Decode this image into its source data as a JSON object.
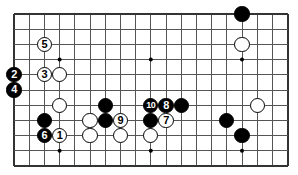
{
  "figure": {
    "name": "go-board-diagram",
    "width": 298,
    "height": 175,
    "background_color": "#ffffff",
    "line_color": "#555555",
    "border_color": "#333333",
    "black_color": "#000000",
    "white_color": "#ffffff"
  },
  "board": {
    "origin_x": 14,
    "origin_y": 14,
    "spacing": 15.2,
    "cols": 19,
    "rows": 11,
    "left_edge": true,
    "top_edge": true,
    "right_edge": true,
    "bottom_edge": true,
    "stone_radius": 7.6,
    "star_points": [
      {
        "col": 3,
        "row": 3
      },
      {
        "col": 9,
        "row": 3
      },
      {
        "col": 15,
        "row": 3
      },
      {
        "col": 3,
        "row": 9
      },
      {
        "col": 9,
        "row": 9
      },
      {
        "col": 15,
        "row": 9
      }
    ]
  },
  "stones": [
    {
      "col": 15,
      "row": 0,
      "color": "black",
      "label": ""
    },
    {
      "col": 2,
      "row": 2,
      "color": "white",
      "label": "5"
    },
    {
      "col": 15,
      "row": 2,
      "color": "white",
      "label": ""
    },
    {
      "col": 0,
      "row": 4,
      "color": "black",
      "label": "2"
    },
    {
      "col": 2,
      "row": 4,
      "color": "white",
      "label": "3"
    },
    {
      "col": 3,
      "row": 4,
      "color": "white",
      "label": ""
    },
    {
      "col": 0,
      "row": 5,
      "color": "black",
      "label": "4"
    },
    {
      "col": 3,
      "row": 6,
      "color": "white",
      "label": ""
    },
    {
      "col": 6,
      "row": 6,
      "color": "black",
      "label": ""
    },
    {
      "col": 9,
      "row": 6,
      "color": "black",
      "label": "10"
    },
    {
      "col": 10,
      "row": 6,
      "color": "black",
      "label": "8"
    },
    {
      "col": 11,
      "row": 6,
      "color": "black",
      "label": ""
    },
    {
      "col": 16,
      "row": 6,
      "color": "white",
      "label": ""
    },
    {
      "col": 2,
      "row": 7,
      "color": "black",
      "label": ""
    },
    {
      "col": 5,
      "row": 7,
      "color": "white",
      "label": ""
    },
    {
      "col": 6,
      "row": 7,
      "color": "black",
      "label": ""
    },
    {
      "col": 7,
      "row": 7,
      "color": "white",
      "label": "9"
    },
    {
      "col": 9,
      "row": 7,
      "color": "black",
      "label": ""
    },
    {
      "col": 10,
      "row": 7,
      "color": "white",
      "label": "7"
    },
    {
      "col": 14,
      "row": 7,
      "color": "black",
      "label": ""
    },
    {
      "col": 15,
      "row": 8,
      "color": "black",
      "label": ""
    },
    {
      "col": 2,
      "row": 8,
      "color": "black",
      "label": "6"
    },
    {
      "col": 3,
      "row": 8,
      "color": "white",
      "label": "1"
    },
    {
      "col": 5,
      "row": 8,
      "color": "white",
      "label": ""
    },
    {
      "col": 7,
      "row": 8,
      "color": "white",
      "label": ""
    },
    {
      "col": 9,
      "row": 8,
      "color": "white",
      "label": ""
    }
  ],
  "move_labels": {
    "1": "white-move-1",
    "2": "black-move-2",
    "3": "white-move-3",
    "4": "black-move-4",
    "5": "white-move-5",
    "6": "black-move-6",
    "7": "white-move-7",
    "8": "black-move-8",
    "9": "white-move-9",
    "10": "black-move-10"
  }
}
